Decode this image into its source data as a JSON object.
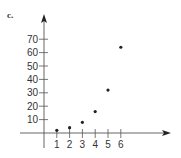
{
  "panel_label": "c.",
  "chart_data": {
    "type": "scatter",
    "title": "",
    "xlabel": "",
    "ylabel": "",
    "x": [
      1,
      2,
      3,
      4,
      5,
      6
    ],
    "y": [
      2,
      4,
      8,
      16,
      32,
      64
    ],
    "x_ticks": [
      1,
      2,
      3,
      4,
      5,
      6
    ],
    "y_ticks": [
      10,
      20,
      30,
      40,
      50,
      60,
      70
    ],
    "xlim": [
      0,
      10
    ],
    "ylim": [
      -20,
      88
    ],
    "grid": false,
    "legend": null,
    "axes_arrows": true
  },
  "colors": {
    "ink": "#222222",
    "axis": "#555555"
  }
}
